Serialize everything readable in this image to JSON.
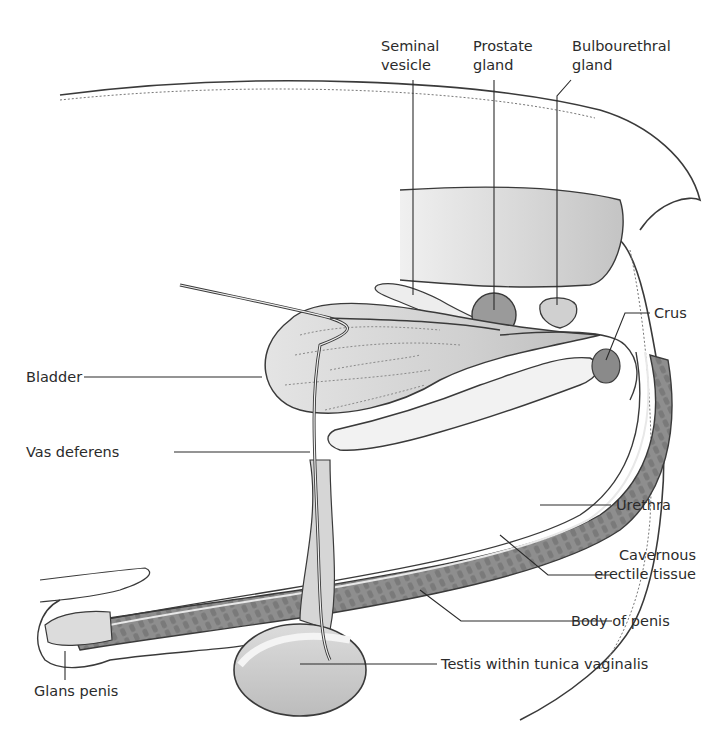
{
  "diagram": {
    "type": "anatomical-cross-section",
    "colors": {
      "outline": "#3a3a3a",
      "fill_light": "#e6e6e6",
      "fill_mid": "#cfcfcf",
      "fill_dark": "#8a8a8a",
      "erectile": "#8e8e8e",
      "background": "#ffffff"
    },
    "labels": {
      "seminal_vesicle": [
        "Seminal",
        "vesicle"
      ],
      "prostate_gland": [
        "Prostate",
        "gland"
      ],
      "bulbourethral_gland": [
        "Bulbourethral",
        "gland"
      ],
      "crus": "Crus",
      "bladder": "Bladder",
      "vas_deferens": "Vas deferens",
      "urethra": "Urethra",
      "cavernous_erectile_tissue": [
        "Cavernous",
        "erectile tissue"
      ],
      "body_of_penis": "Body of penis",
      "testis": "Testis within tunica vaginalis",
      "glans_penis": "Glans penis"
    }
  }
}
